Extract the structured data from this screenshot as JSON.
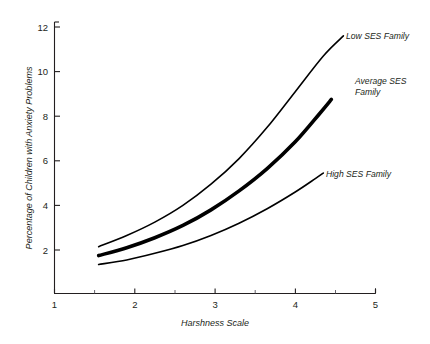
{
  "chart_data": {
    "type": "line",
    "title": "",
    "xlabel": "Harshness Scale",
    "ylabel": "Percentage of Children with Anxiety Problems",
    "xlim": [
      1,
      5
    ],
    "ylim": [
      0,
      12.6
    ],
    "x_ticks": [
      "1",
      "2",
      "3",
      "4",
      "5"
    ],
    "x_tick_values": [
      1,
      2,
      3,
      4,
      5
    ],
    "x_minor_ticks": [
      1.5,
      2.5,
      3.5,
      4.5
    ],
    "y_ticks": [
      "2",
      "4",
      "6",
      "8",
      "10",
      "12"
    ],
    "y_tick_values": [
      2,
      4,
      6,
      8,
      10,
      12
    ],
    "grid": false,
    "legend_position": "inline-right-of-curve-ends",
    "series": [
      {
        "name": "Low SES Family",
        "label": "Low SES Family",
        "style": "thin",
        "x": [
          1.55,
          1.9,
          2.25,
          2.6,
          2.95,
          3.3,
          3.65,
          4.0,
          4.35,
          4.6
        ],
        "values": [
          2.15,
          2.65,
          3.25,
          4.0,
          4.95,
          6.1,
          7.5,
          9.1,
          10.7,
          11.6
        ]
      },
      {
        "name": "Average SES Family",
        "label": "Average SES Family",
        "style": "thick",
        "x": [
          1.55,
          1.9,
          2.25,
          2.6,
          2.95,
          3.3,
          3.65,
          4.0,
          4.3,
          4.45
        ],
        "values": [
          1.75,
          2.1,
          2.55,
          3.1,
          3.8,
          4.65,
          5.65,
          6.85,
          8.1,
          8.75
        ]
      },
      {
        "name": "High SES Family",
        "label": "High SES Family",
        "style": "thin",
        "x": [
          1.55,
          1.9,
          2.25,
          2.6,
          2.95,
          3.3,
          3.65,
          4.0,
          4.25,
          4.35
        ],
        "values": [
          1.35,
          1.55,
          1.85,
          2.2,
          2.65,
          3.2,
          3.85,
          4.6,
          5.2,
          5.45
        ]
      }
    ],
    "annotations": [
      {
        "text": "Low SES Family",
        "x": 4.7,
        "y": 11.75
      },
      {
        "text": "Average SES Family",
        "x": 4.52,
        "y": 9.45,
        "lines": [
          "Average SES",
          "Family"
        ]
      },
      {
        "text": "High SES Family",
        "x": 4.42,
        "y": 5.75
      }
    ]
  }
}
